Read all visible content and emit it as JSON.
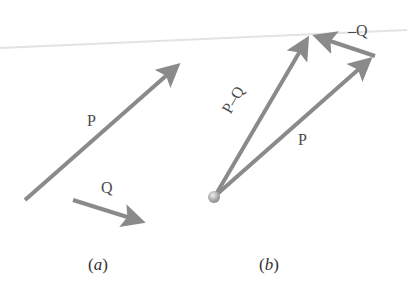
{
  "figure": {
    "panel_a": {
      "caption": "a",
      "vectors": [
        {
          "name": "P",
          "label": "P"
        },
        {
          "name": "Q",
          "label": "Q"
        }
      ]
    },
    "panel_b": {
      "caption": "b",
      "vectors": [
        {
          "name": "P",
          "label": "P"
        },
        {
          "name": "P-Q",
          "label": "P–Q"
        },
        {
          "name": "-Q",
          "label": "–Q"
        }
      ]
    },
    "colors": {
      "arrow": "#8a8a8a",
      "text": "#4a4a4a",
      "origin_ball": "#b5b5b5"
    }
  }
}
